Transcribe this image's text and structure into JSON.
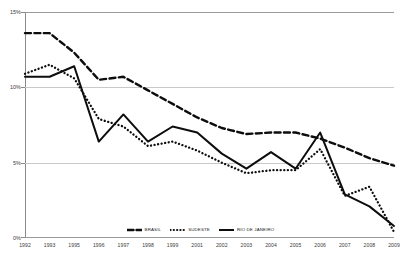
{
  "chart_data": {
    "type": "line",
    "title": "",
    "xlabel": "",
    "ylabel": "",
    "ylim": [
      0,
      15
    ],
    "ytick_labels": [
      "15%",
      "10%",
      "5%",
      "0%"
    ],
    "ytick_values": [
      15,
      10,
      5,
      0
    ],
    "grid": true,
    "legend_position": "bottom",
    "categories": [
      "1992",
      "1993",
      "1995",
      "1996",
      "1997",
      "1998",
      "1999",
      "2001",
      "2002",
      "2003",
      "2004",
      "2005",
      "2006",
      "2007",
      "2008",
      "2009"
    ],
    "series": [
      {
        "name": "BRASIL",
        "style": "dashed",
        "color": "#0d0d0d",
        "values": [
          13.6,
          13.6,
          12.3,
          10.5,
          10.7,
          9.8,
          8.9,
          8.0,
          7.3,
          6.9,
          7.0,
          7.0,
          6.6,
          6.0,
          5.3,
          4.8
        ]
      },
      {
        "name": "SUDESTE",
        "style": "dotted",
        "color": "#0d0d0d",
        "values": [
          10.9,
          11.5,
          10.6,
          7.9,
          7.4,
          6.1,
          6.4,
          5.8,
          5.0,
          4.3,
          4.5,
          4.5,
          5.9,
          2.8,
          3.4,
          0.4
        ]
      },
      {
        "name": "RIO DE JANEIRO",
        "style": "solid",
        "color": "#0d0d0d",
        "values": [
          10.7,
          10.7,
          11.4,
          6.4,
          8.2,
          6.4,
          7.4,
          7.0,
          5.6,
          4.6,
          5.7,
          4.6,
          7.0,
          2.9,
          2.1,
          0.8
        ]
      }
    ]
  },
  "legend": {
    "items": [
      {
        "label": "BRASIL",
        "style": "dashed"
      },
      {
        "label": "SUDESTE",
        "style": "dotted"
      },
      {
        "label": "RIO DE JANEIRO",
        "style": "solid"
      }
    ]
  }
}
